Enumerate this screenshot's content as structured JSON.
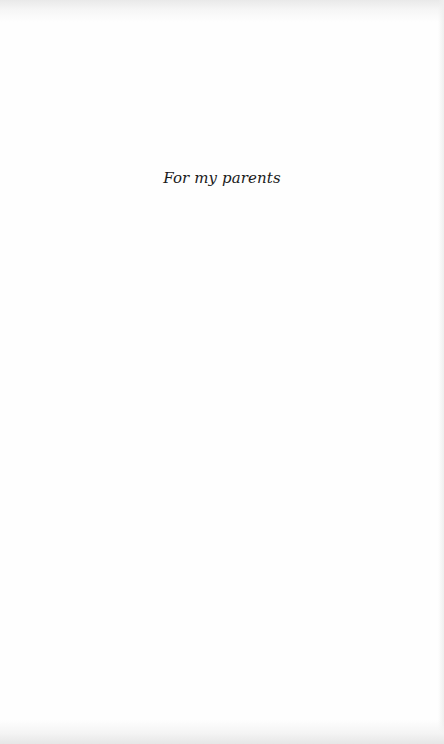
{
  "page": {
    "type": "dedication",
    "dedication_text": "For my parents",
    "colors": {
      "background": "#fefefe",
      "text": "#1a1a1a",
      "edge_shadow": "#e8e8e8"
    }
  }
}
